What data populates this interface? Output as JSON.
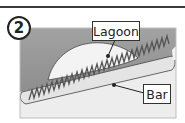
{
  "figure": {
    "step_number": "2",
    "labels": {
      "lagoon": "Lagoon",
      "bar": "Bar"
    },
    "colors": {
      "sea": "#9a9a9a",
      "lagoon": "#f2f2f2",
      "bar_fill": "#e6e6e6",
      "shore": "#eeeeee",
      "outline": "#333333",
      "zigzag": "#555555"
    }
  }
}
